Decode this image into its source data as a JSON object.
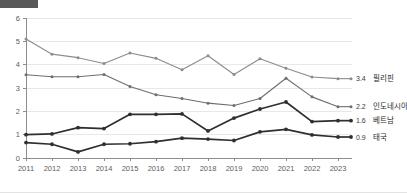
{
  "chart_data": {
    "type": "line",
    "title": "",
    "xlabel": "",
    "ylabel": "",
    "ylim": [
      0,
      6
    ],
    "yticks": [
      0,
      1,
      2,
      3,
      4,
      5,
      6
    ],
    "grid": true,
    "legend_position": "right-end-labels",
    "categories": [
      "2011",
      "2012",
      "2013",
      "2014",
      "2015",
      "2016",
      "2017",
      "2018",
      "2019",
      "2020",
      "2021",
      "2022",
      "2023"
    ],
    "series": [
      {
        "name": "필리핀",
        "color": "#8c8c8c",
        "end_value": "3.4",
        "values": [
          5.1,
          4.45,
          4.3,
          4.05,
          4.5,
          4.27,
          3.78,
          4.38,
          3.58,
          4.25,
          3.85,
          3.47,
          3.4
        ]
      },
      {
        "name": "인도네시아",
        "color": "#6e6e6e",
        "end_value": "2.2",
        "values": [
          3.57,
          3.48,
          3.48,
          3.58,
          3.06,
          2.71,
          2.55,
          2.35,
          2.25,
          2.55,
          3.42,
          2.62,
          2.2
        ]
      },
      {
        "name": "베트남",
        "color": "#2f2f2f",
        "end_value": "1.6",
        "values": [
          1.0,
          1.03,
          1.3,
          1.26,
          1.87,
          1.87,
          1.89,
          1.16,
          1.71,
          2.1,
          2.4,
          1.56,
          1.6
        ]
      },
      {
        "name": "태국",
        "color": "#2f2f2f",
        "end_value": "0.9",
        "values": [
          0.66,
          0.59,
          0.26,
          0.59,
          0.61,
          0.7,
          0.85,
          0.81,
          0.75,
          1.12,
          1.23,
          0.99,
          0.9
        ]
      }
    ]
  }
}
